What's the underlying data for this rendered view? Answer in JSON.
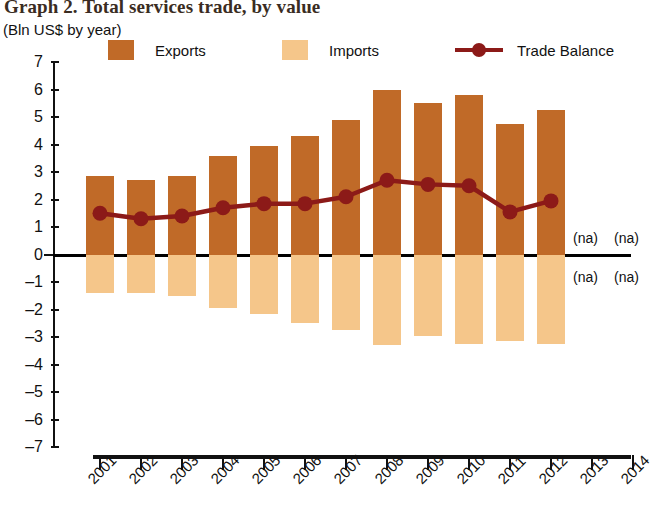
{
  "header": {
    "title": "Graph 2. Total services trade, by value",
    "subtitle": "(Bln US$ by year)"
  },
  "legend": {
    "items": [
      {
        "label": "Exports",
        "color": "#C06A28",
        "marker": "square"
      },
      {
        "label": "Imports",
        "color": "#F5C68A",
        "marker": "square"
      },
      {
        "label": "Trade Balance",
        "color": "#8C1A18",
        "marker": "line-dot"
      }
    ]
  },
  "annotations": {
    "na_label": "(na)",
    "na_points": [
      {
        "year": "2013",
        "position": "above-zero"
      },
      {
        "year": "2014",
        "position": "above-zero"
      },
      {
        "year": "2013",
        "position": "below-zero"
      },
      {
        "year": "2014",
        "position": "below-zero"
      }
    ]
  },
  "chart_data": {
    "type": "bar",
    "title": "Graph 2. Total services trade, by value",
    "subtitle": "(Bln US$ by year)",
    "xlabel": "",
    "ylabel": "",
    "ylim": [
      -7,
      7
    ],
    "yticks": [
      7,
      6,
      5,
      4,
      3,
      2,
      1,
      0,
      -1,
      -2,
      -3,
      -4,
      -5,
      -6,
      -7
    ],
    "ytick_labels": [
      "7",
      "6",
      "5",
      "4",
      "3",
      "2",
      "1",
      "0",
      "–1",
      "–2",
      "–3",
      "–4",
      "–5",
      "–6",
      "–7"
    ],
    "grid": false,
    "legend_position": "top",
    "categories": [
      "2001",
      "2002",
      "2003",
      "2004",
      "2005",
      "2006",
      "2007",
      "2008",
      "2009",
      "2010",
      "2011",
      "2012",
      "2013",
      "2014"
    ],
    "series": [
      {
        "name": "Exports",
        "type": "bar",
        "color": "#C06A28",
        "values": [
          2.85,
          2.7,
          2.85,
          3.6,
          3.95,
          4.3,
          4.9,
          6.0,
          5.5,
          5.8,
          4.75,
          5.25,
          null,
          null
        ]
      },
      {
        "name": "Imports",
        "type": "bar",
        "color": "#F5C68A",
        "values": [
          -1.4,
          -1.4,
          -1.5,
          -1.95,
          -2.15,
          -2.5,
          -2.75,
          -3.3,
          -2.95,
          -3.25,
          -3.15,
          -3.25,
          null,
          null
        ]
      },
      {
        "name": "Trade Balance",
        "type": "line",
        "color": "#8C1A18",
        "values": [
          1.5,
          1.3,
          1.4,
          1.7,
          1.85,
          1.85,
          2.1,
          2.7,
          2.55,
          2.5,
          1.55,
          1.95,
          null,
          null
        ]
      }
    ]
  }
}
